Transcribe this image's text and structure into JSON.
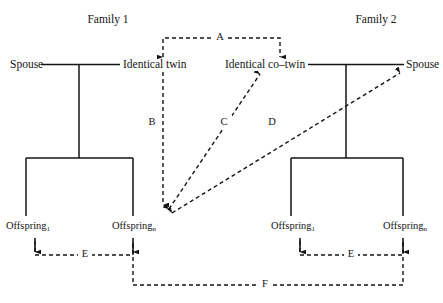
{
  "diagram": {
    "title_hidden": "Twin family design path diagram",
    "families": [
      {
        "id": "family-1",
        "title": "Family 1",
        "spouse_label": "Spouse",
        "twin_label": "Identical twin",
        "offspring_first_name": "Offspring",
        "offspring_first_sub": "1",
        "offspring_last_name": "Offspring",
        "offspring_last_sub": "n"
      },
      {
        "id": "family-2",
        "title": "Family 2",
        "spouse_label": "Spouse",
        "twin_label": "Identical co–twin",
        "offspring_first_name": "Offspring",
        "offspring_first_sub": "1",
        "offspring_last_name": "Offspring",
        "offspring_last_sub": "n"
      }
    ],
    "paths": [
      {
        "id": "path-a",
        "label": "A",
        "style": "dashed",
        "arrowheads": "both",
        "description": "Identical twin ↔ Identical co-twin"
      },
      {
        "id": "path-b",
        "label": "B",
        "style": "dashed",
        "arrowheads": "single",
        "description": "Identical twin → own Offspring n"
      },
      {
        "id": "path-c",
        "label": "C",
        "style": "dashed",
        "arrowheads": "both",
        "description": "Identical co-twin ↔ Family 1 Offspring n"
      },
      {
        "id": "path-d",
        "label": "D",
        "style": "dashed",
        "arrowheads": "both",
        "description": "Family 2 Spouse ↔ Family 1 Offspring n"
      },
      {
        "id": "path-e1",
        "label": "E",
        "style": "dashed",
        "arrowheads": "both",
        "description": "Family 1 Offspring 1 ↔ Offspring n"
      },
      {
        "id": "path-e2",
        "label": "E",
        "style": "dashed",
        "arrowheads": "both",
        "description": "Family 2 Offspring 1 ↔ Offspring n"
      },
      {
        "id": "path-f",
        "label": "F",
        "style": "dashed",
        "arrowheads": "none",
        "description": "Family 1 Offspring n ↔ Family 2 Offspring n"
      }
    ],
    "colors": {
      "line": "#141414",
      "text": "#141414",
      "background": "#ffffff"
    }
  }
}
